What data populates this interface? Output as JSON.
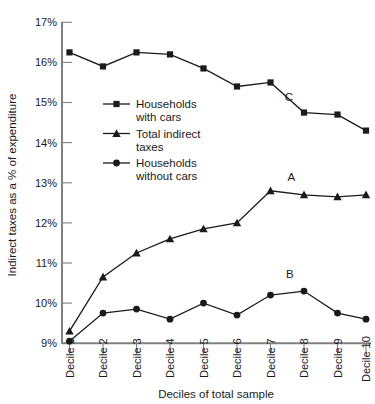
{
  "chart_data": {
    "type": "line",
    "title": "",
    "xlabel": "Deciles of total sample",
    "ylabel": "Indirect taxes as a % of expenditure",
    "categories": [
      "Decile 1",
      "Decile 2",
      "Decile 3",
      "Decile 4",
      "Decile 5",
      "Decile 6",
      "Decile 7",
      "Decile 8",
      "Decile 9",
      "Decile 10"
    ],
    "ylim": [
      9,
      17
    ],
    "yticks": [
      9,
      10,
      11,
      12,
      13,
      14,
      15,
      16,
      17
    ],
    "ytick_labels": [
      "9%",
      "10%",
      "11%",
      "12%",
      "13%",
      "14%",
      "15%",
      "16%",
      "17%"
    ],
    "grid": false,
    "legend_position": "inside-upper-left",
    "series": [
      {
        "name": "Households with cars",
        "marker": "square",
        "annotation": "C",
        "values": [
          16.25,
          15.9,
          16.25,
          16.2,
          15.85,
          15.4,
          15.5,
          14.75,
          14.7,
          14.3
        ]
      },
      {
        "name": "Total indirect taxes",
        "marker": "triangle",
        "annotation": "A",
        "values": [
          9.3,
          10.65,
          11.25,
          11.6,
          11.85,
          12.0,
          12.8,
          12.7,
          12.65,
          12.7
        ]
      },
      {
        "name": "Households without cars",
        "marker": "circle",
        "annotation": "B",
        "values": [
          9.05,
          9.75,
          9.85,
          9.6,
          10.0,
          9.7,
          10.2,
          10.3,
          9.75,
          9.6
        ]
      }
    ],
    "annotations": [
      {
        "text": "C",
        "x": 7.55,
        "y": 15.03
      },
      {
        "text": "A",
        "x": 7.62,
        "y": 13.05
      },
      {
        "text": "B",
        "x": 7.58,
        "y": 10.62
      }
    ],
    "colors": {
      "line": "#1a1a1a",
      "marker": "#1a1a1a",
      "axis": "#808080",
      "background": "#ffffff"
    }
  },
  "legend": {
    "entries": [
      {
        "label_line1": "Households",
        "label_line2": "with cars",
        "marker": "square-marker"
      },
      {
        "label_line1": "Total indirect",
        "label_line2": "taxes",
        "marker": "triangle-marker"
      },
      {
        "label_line1": "Households",
        "label_line2": "without cars",
        "marker": "circle-marker"
      }
    ]
  }
}
